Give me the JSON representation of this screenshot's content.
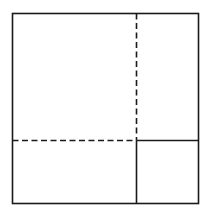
{
  "diagram": {
    "stroke_color": "#1a1a1a",
    "background": "#ffffff",
    "outer_square": {
      "x": 12,
      "y": 13,
      "w": 186,
      "h": 190
    },
    "solid_divider_vertical": {
      "x": 136,
      "y1": 140,
      "y2": 203
    },
    "solid_divider_horizontal": {
      "y": 140,
      "x1": 136,
      "x2": 198
    },
    "dashed_vertical": {
      "x": 136,
      "y1": 13,
      "y2": 140
    },
    "dashed_horizontal": {
      "y": 140,
      "x1": 12,
      "x2": 136
    }
  }
}
